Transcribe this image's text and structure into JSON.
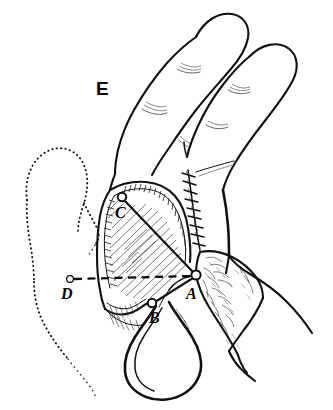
{
  "figure": {
    "panel_label": "E",
    "caption_absent": true,
    "background_color": "#ffffff",
    "ink_color": "#111111",
    "width": 333,
    "height": 410
  },
  "labels": {
    "panel": {
      "text": "E",
      "x": 96,
      "y": 95
    },
    "point_a": {
      "text": "A",
      "x": 186,
      "y": 299,
      "marker_x": 196,
      "marker_y": 275,
      "marker_r": 4.6
    },
    "point_b": {
      "text": "B",
      "x": 149,
      "y": 323,
      "marker_x": 152,
      "marker_y": 303,
      "marker_r": 4.2
    },
    "point_c": {
      "text": "C",
      "x": 115,
      "y": 218,
      "marker_x": 122,
      "marker_y": 197,
      "marker_r": 4.2
    },
    "point_d": {
      "text": "D",
      "x": 61,
      "y": 299,
      "marker_x": 70,
      "marker_y": 279,
      "marker_r": 3.4
    }
  },
  "annotations": {
    "dashed_measure_line": {
      "from": "D",
      "to": "A",
      "style": "dashed"
    },
    "flap_axis_line": {
      "from": "C",
      "to": "A",
      "style": "solid"
    },
    "pedicle_line": {
      "from": "A",
      "to": "B",
      "style": "solid"
    },
    "phantom_outline": {
      "name": "original-thumb-position",
      "style": "dotted"
    }
  },
  "regions": {
    "index_finger": "index-finger",
    "middle_finger": "middle-finger",
    "flap": "hatched-osteoplastic-flap",
    "suture_line": "suture-line",
    "pedicle_loop": "tubed-pedicle-loop",
    "raw_surface": "granulating-raw-surface",
    "phantom_thumb": "phantom-thumb-outline"
  }
}
